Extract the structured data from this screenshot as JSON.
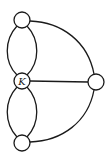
{
  "diagram": {
    "type": "graph",
    "stroke_color": "#1a1a1a",
    "background": "#ffffff",
    "nodes": [
      {
        "id": "top",
        "label": "",
        "x": 22,
        "y": 20,
        "r": 8
      },
      {
        "id": "center",
        "label": "K",
        "x": 22,
        "y": 81,
        "r": 8
      },
      {
        "id": "right",
        "label": "",
        "x": 96,
        "y": 82,
        "r": 8
      },
      {
        "id": "bottom",
        "label": "",
        "x": 22,
        "y": 143,
        "r": 8
      }
    ],
    "edges": [
      {
        "from": "top",
        "to": "center",
        "style": "curved-left"
      },
      {
        "from": "top",
        "to": "center",
        "style": "curved-right"
      },
      {
        "from": "center",
        "to": "bottom",
        "style": "curved-left"
      },
      {
        "from": "center",
        "to": "bottom",
        "style": "curved-right"
      },
      {
        "from": "top",
        "to": "right",
        "style": "arc"
      },
      {
        "from": "center",
        "to": "right",
        "style": "straight"
      },
      {
        "from": "bottom",
        "to": "right",
        "style": "arc"
      }
    ]
  }
}
